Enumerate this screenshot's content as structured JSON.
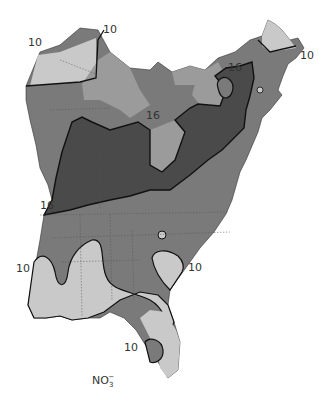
{
  "map": {
    "title_symbol": "NO",
    "title_subscript": "3",
    "title_superscript": "−",
    "colors": {
      "background": "#ffffff",
      "lowest": "#c9c9c9",
      "low": "#9b9b9b",
      "mid": "#7a7a7a",
      "highest": "#4a4a4a",
      "contour": "#1a1a1a",
      "state_border": "#555555"
    },
    "contour_labels": [
      {
        "text": "10",
        "x": 28,
        "y": 42
      },
      {
        "text": "10",
        "x": 103,
        "y": 27
      },
      {
        "text": "16",
        "x": 148,
        "y": 110
      },
      {
        "text": "16",
        "x": 227,
        "y": 64
      },
      {
        "text": "10",
        "x": 296,
        "y": 54
      },
      {
        "text": "16",
        "x": 38,
        "y": 198
      },
      {
        "text": "10",
        "x": 16,
        "y": 265
      },
      {
        "text": "10",
        "x": 188,
        "y": 262
      },
      {
        "text": "10",
        "x": 125,
        "y": 345
      }
    ]
  }
}
